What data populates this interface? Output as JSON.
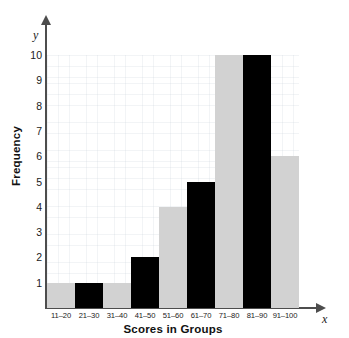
{
  "chart_data": {
    "type": "bar",
    "title": "",
    "xlabel": "Scores in Groups",
    "ylabel": "Frequency",
    "x_axis_symbol": "x",
    "y_axis_symbol": "y",
    "categories": [
      "11–20",
      "21–30",
      "31–40",
      "41–50",
      "51–60",
      "61–70",
      "71–80",
      "81–90",
      "91–100"
    ],
    "values": [
      1,
      1,
      1,
      2,
      4,
      5,
      10,
      10,
      6
    ],
    "bar_colors": [
      "#d2d2d2",
      "#000000",
      "#d2d2d2",
      "#000000",
      "#d2d2d2",
      "#000000",
      "#d2d2d2",
      "#000000",
      "#d2d2d2"
    ],
    "ylim": [
      0,
      10
    ],
    "y_ticks": [
      10,
      9,
      8,
      7,
      6,
      5,
      4,
      3,
      2,
      1
    ],
    "grid": true,
    "legend": "none",
    "axis_color": "#4d4d4d",
    "grid_color": "#becad2",
    "background": "#ffffff"
  }
}
